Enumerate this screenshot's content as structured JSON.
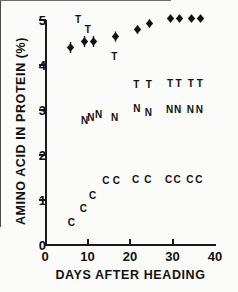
{
  "chart_data": {
    "type": "scatter",
    "title": "",
    "xlabel": "DAYS AFTER HEADING",
    "ylabel": "AMINO ACID IN PROTEIN (%)",
    "xlim": [
      0,
      40
    ],
    "ylim": [
      0,
      5
    ],
    "xticks": [
      "0",
      "10",
      "20",
      "30",
      "40"
    ],
    "xtick_values": [
      0,
      10,
      20,
      30,
      40
    ],
    "yticks": [
      "0",
      "1",
      "2",
      "3",
      "4",
      "5"
    ],
    "ytick_values": [
      0,
      1,
      2,
      3,
      4,
      5
    ],
    "grid": false,
    "legend": "none",
    "series": [
      {
        "name": "total-protein-marker",
        "marker": "filled-diamond-with-error-bars",
        "points": [
          {
            "x": 6.0,
            "y": 4.4,
            "err": 0.1
          },
          {
            "x": 9.3,
            "y": 4.52,
            "err": 0.1
          },
          {
            "x": 11.5,
            "y": 4.52,
            "err": 0.1
          },
          {
            "x": 16.5,
            "y": 4.64,
            "err": 0.09
          },
          {
            "x": 21.8,
            "y": 4.78,
            "err": 0.07
          },
          {
            "x": 24.7,
            "y": 4.92,
            "err": 0.07
          },
          {
            "x": 29.6,
            "y": 5.04,
            "err": 0.06
          },
          {
            "x": 31.6,
            "y": 5.04,
            "err": 0.06
          },
          {
            "x": 34.4,
            "y": 5.04,
            "err": 0.06
          },
          {
            "x": 36.6,
            "y": 5.04,
            "err": 0.06
          }
        ]
      },
      {
        "name": "T-series",
        "marker": "letter-T",
        "points": [
          {
            "x": 7.8,
            "y": 5.0
          },
          {
            "x": 10.1,
            "y": 4.78
          },
          {
            "x": 16.3,
            "y": 4.18
          },
          {
            "x": 21.5,
            "y": 3.55
          },
          {
            "x": 24.4,
            "y": 3.55
          },
          {
            "x": 29.4,
            "y": 3.57
          },
          {
            "x": 31.4,
            "y": 3.57
          },
          {
            "x": 34.3,
            "y": 3.57
          },
          {
            "x": 36.4,
            "y": 3.57
          }
        ]
      },
      {
        "name": "N-series",
        "marker": "letter-N",
        "points": [
          {
            "x": 9.3,
            "y": 2.76
          },
          {
            "x": 10.8,
            "y": 2.82
          },
          {
            "x": 12.6,
            "y": 2.88
          },
          {
            "x": 16.4,
            "y": 2.82
          },
          {
            "x": 21.6,
            "y": 3.02
          },
          {
            "x": 24.3,
            "y": 2.94
          },
          {
            "x": 29.3,
            "y": 3.0
          },
          {
            "x": 31.2,
            "y": 3.0
          },
          {
            "x": 34.2,
            "y": 3.0
          },
          {
            "x": 36.3,
            "y": 3.0
          }
        ]
      },
      {
        "name": "C-series",
        "marker": "letter-C",
        "points": [
          {
            "x": 6.2,
            "y": 0.5
          },
          {
            "x": 9.0,
            "y": 0.8
          },
          {
            "x": 11.2,
            "y": 1.08
          },
          {
            "x": 14.3,
            "y": 1.42
          },
          {
            "x": 16.8,
            "y": 1.42
          },
          {
            "x": 21.3,
            "y": 1.44
          },
          {
            "x": 24.2,
            "y": 1.44
          },
          {
            "x": 29.1,
            "y": 1.44
          },
          {
            "x": 31.1,
            "y": 1.44
          },
          {
            "x": 34.1,
            "y": 1.44
          },
          {
            "x": 36.2,
            "y": 1.44
          }
        ]
      }
    ]
  }
}
